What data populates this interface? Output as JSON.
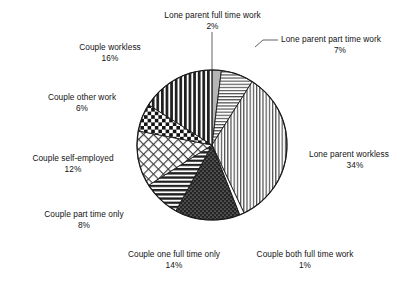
{
  "chart_data": {
    "type": "pie",
    "title": "",
    "subtitle": "",
    "xlabel": "",
    "ylabel": "",
    "legend_position": "none",
    "grid": false,
    "unit": "%",
    "categories": [
      "Lone parent full time work",
      "Lone parent part time work",
      "Lone parent workless",
      "Couple both full time work",
      "Couple one full time only",
      "Couple part time only",
      "Couple self-employed",
      "Couple other work",
      "Couple workless"
    ],
    "values": [
      2,
      7,
      34,
      1,
      14,
      8,
      12,
      6,
      16
    ],
    "slices": [
      {
        "label": "Lone parent full time work",
        "value": 2,
        "value_text": "2%",
        "pattern": "solid-gray",
        "fill": "#b5b5b5"
      },
      {
        "label": "Lone parent part time work",
        "value": 7,
        "value_text": "7%",
        "pattern": "horizontal-lines-light",
        "fill": "#ffffff"
      },
      {
        "label": "Lone parent workless",
        "value": 34,
        "value_text": "34%",
        "pattern": "vertical-lines-light",
        "fill": "#ffffff"
      },
      {
        "label": "Couple both full time work",
        "value": 1,
        "value_text": "1%",
        "pattern": "blank-white",
        "fill": "#ffffff"
      },
      {
        "label": "Couple one full time only",
        "value": 14,
        "value_text": "14%",
        "pattern": "dark-dotted",
        "fill": "#242424"
      },
      {
        "label": "Couple part time only",
        "value": 8,
        "value_text": "8%",
        "pattern": "horizontal-lines-bold",
        "fill": "#ffffff"
      },
      {
        "label": "Couple self-employed",
        "value": 12,
        "value_text": "12%",
        "pattern": "diagonal-crosshatch",
        "fill": "#ffffff"
      },
      {
        "label": "Couple other work",
        "value": 6,
        "value_text": "6%",
        "pattern": "checkerboard",
        "fill": "#ffffff"
      },
      {
        "label": "Couple workless",
        "value": 16,
        "value_text": "16%",
        "pattern": "vertical-lines-bold",
        "fill": "#ffffff"
      }
    ]
  },
  "labels": {
    "lone_parent_full_time": {
      "name": "Lone parent full time work",
      "pct": "2%"
    },
    "lone_parent_part_time": {
      "name": "Lone parent part time work",
      "pct": "7%"
    },
    "lone_parent_workless": {
      "name": "Lone parent workless",
      "pct": "34%"
    },
    "couple_both_full_time": {
      "name": "Couple both full time work",
      "pct": "1%"
    },
    "couple_one_full_time": {
      "name": "Couple one full time only",
      "pct": "14%"
    },
    "couple_part_time": {
      "name": "Couple part time only",
      "pct": "8%"
    },
    "couple_self_employed": {
      "name": "Couple self-employed",
      "pct": "12%"
    },
    "couple_other_work": {
      "name": "Couple other work",
      "pct": "6%"
    },
    "couple_workless": {
      "name": "Couple workless",
      "pct": "16%"
    }
  },
  "colors": {
    "outline": "#1a1a1a",
    "text": "#121212",
    "background": "#ffffff",
    "dark_slice": "#242424",
    "gray_slice": "#b5b5b5"
  }
}
